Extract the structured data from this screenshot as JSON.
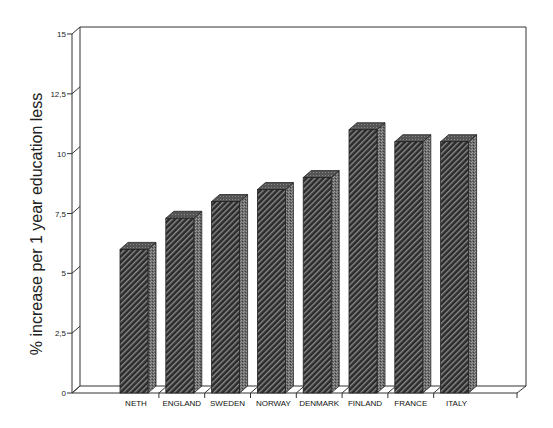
{
  "chart_data": {
    "type": "bar",
    "style": "3d-bar",
    "title": "",
    "xlabel": "",
    "ylabel": "% increase per 1 year education less",
    "categories": [
      "NETH",
      "ENGLAND",
      "SWEDEN",
      "NORWAY",
      "DENMARK",
      "FINLAND",
      "FRANCE",
      "ITALY"
    ],
    "values": [
      6.0,
      7.3,
      8.0,
      8.5,
      9.0,
      11.0,
      10.5,
      10.5
    ],
    "ylim": [
      0,
      15
    ],
    "yticks": [
      0,
      2.5,
      5,
      7.5,
      10,
      12.5,
      15
    ],
    "ytick_labels": [
      "0",
      "2,5",
      "5",
      "7,5",
      "10",
      "12,5",
      "15"
    ],
    "grid": false,
    "legend": null,
    "bar_fill": "diagonal hatch",
    "colors": {
      "bar_front": "#2b2b2b",
      "bar_hatch": "#8a8a8a",
      "bar_top": "#5a5a5a",
      "bar_side": "#777777",
      "axis": "#333333"
    }
  }
}
